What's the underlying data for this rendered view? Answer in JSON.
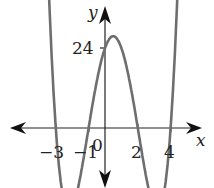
{
  "chart_data": {
    "type": "line",
    "title": "",
    "xlabel": "x",
    "ylabel": "y",
    "function": "y = (x+3)(x+1)(x-2)(x-4)",
    "x_tick_labels": [
      "-3",
      "-1",
      "0",
      "2",
      "4"
    ],
    "y_tick_labels": [
      "24"
    ],
    "zeros": [
      -3,
      -1,
      2,
      4
    ],
    "y_intercept": 24,
    "annotations": [
      "24",
      "-3",
      "-1",
      "0",
      "2",
      "4"
    ],
    "grid": false,
    "legend": null,
    "xlim": [
      -6.3,
      6.5
    ],
    "ylim": [
      -36,
      38
    ],
    "series": [
      {
        "name": "polynomial",
        "x": [
          -3.6,
          -3.3,
          -3,
          -2.5,
          -2,
          -1.5,
          -1,
          -0.5,
          0,
          0.5,
          1,
          1.5,
          2,
          2.5,
          3,
          3.5,
          4,
          4.3,
          4.6
        ],
        "y": [
          26.2,
          10.8,
          0,
          -14.1,
          -16,
          -8.1,
          0,
          10.3,
          24,
          24.8,
          24,
          13.8,
          0,
          -10.3,
          -15.5,
          -11.4,
          0,
          12.8,
          25.3
        ]
      }
    ],
    "colors": {
      "curve": "#6e6e6e",
      "axes": "#222222"
    }
  },
  "labels": {
    "x_axis": "x",
    "y_axis": "y",
    "y24": "24",
    "xm3": "−3",
    "xm1": "−1",
    "x0": "0",
    "x2": "2",
    "x4": "4"
  }
}
